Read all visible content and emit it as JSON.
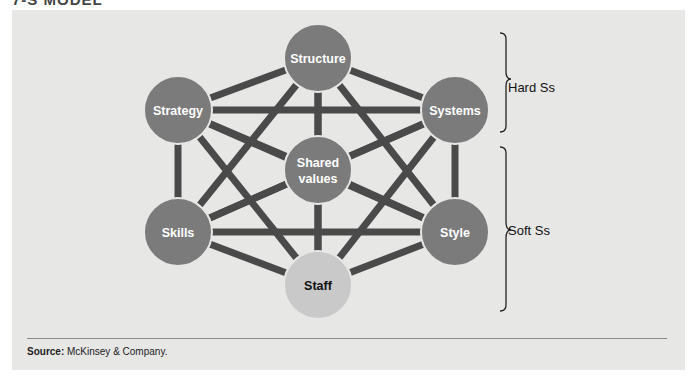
{
  "title": "7-S MODEL",
  "colors": {
    "panel_bg": "#e7e7e6",
    "node_fill": "#7b7b7b",
    "staff_fill": "#c9c9c9",
    "line": "#4a4a4a",
    "node_text": "#ffffff",
    "staff_text": "#111111"
  },
  "nodes": [
    {
      "id": "structure",
      "label": "Structure",
      "x": 318,
      "y": 58,
      "group": "hard"
    },
    {
      "id": "strategy",
      "label": "Strategy",
      "x": 178,
      "y": 110,
      "group": "hard"
    },
    {
      "id": "systems",
      "label": "Systems",
      "x": 455,
      "y": 110,
      "group": "hard"
    },
    {
      "id": "shared_values",
      "label": "Shared values",
      "line1": "Shared",
      "line2": "values",
      "x": 318,
      "y": 170,
      "group": "soft"
    },
    {
      "id": "skills",
      "label": "Skills",
      "x": 178,
      "y": 232,
      "group": "soft"
    },
    {
      "id": "style",
      "label": "Style",
      "x": 455,
      "y": 232,
      "group": "soft"
    },
    {
      "id": "staff",
      "label": "Staff",
      "x": 318,
      "y": 285,
      "group": "soft"
    }
  ],
  "edges": "all-pairs",
  "braces": {
    "hard": {
      "label": "Hard Ss"
    },
    "soft": {
      "label": "Soft Ss"
    }
  },
  "footer": {
    "source_label": "Source:",
    "source_text": " McKinsey & Company."
  }
}
